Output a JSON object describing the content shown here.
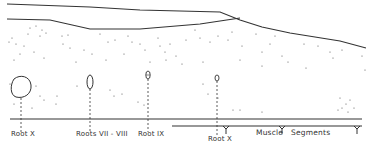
{
  "diagram": {
    "type": "anatomical-section-sketch",
    "labels": {
      "root_x": "Root X",
      "roots_vii_viii": "Roots VII - VIII",
      "root_ix": "Root IX",
      "root_x2": "Root X",
      "muscle": "Muscle",
      "segments": "Segments"
    },
    "colors": {
      "line": "#333333",
      "dots": "#555555",
      "background": "#ffffff"
    }
  }
}
